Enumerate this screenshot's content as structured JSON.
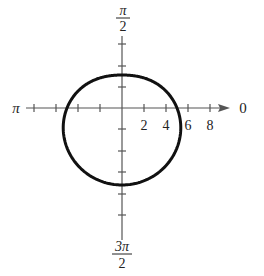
{
  "figure": {
    "type": "polar-graph",
    "equation": "r = 5 - 2 sin θ",
    "axis_labels": {
      "right": "0",
      "top_num": "π",
      "top_den": "2",
      "left": "π",
      "bottom_num": "3π",
      "bottom_den": "2"
    },
    "radial_tick_labels": [
      "2",
      "4",
      "6",
      "8"
    ],
    "colors": {
      "axis": "#555555",
      "curve": "#111111",
      "text": "#222222"
    }
  },
  "chart_data": {
    "type": "line",
    "title": "",
    "coordinate_system": "polar",
    "equation": "r = 5 - 2 sin(theta)",
    "radial_ticks": [
      2,
      4,
      6,
      8
    ],
    "angle_labels": [
      "0",
      "π/2",
      "π",
      "3π/2"
    ],
    "key_points": [
      {
        "theta": "0",
        "r": 5
      },
      {
        "theta": "π/2",
        "r": 3
      },
      {
        "theta": "π",
        "r": 5
      },
      {
        "theta": "3π/2",
        "r": 7
      }
    ],
    "rlim": [
      0,
      9
    ],
    "grid": false
  }
}
